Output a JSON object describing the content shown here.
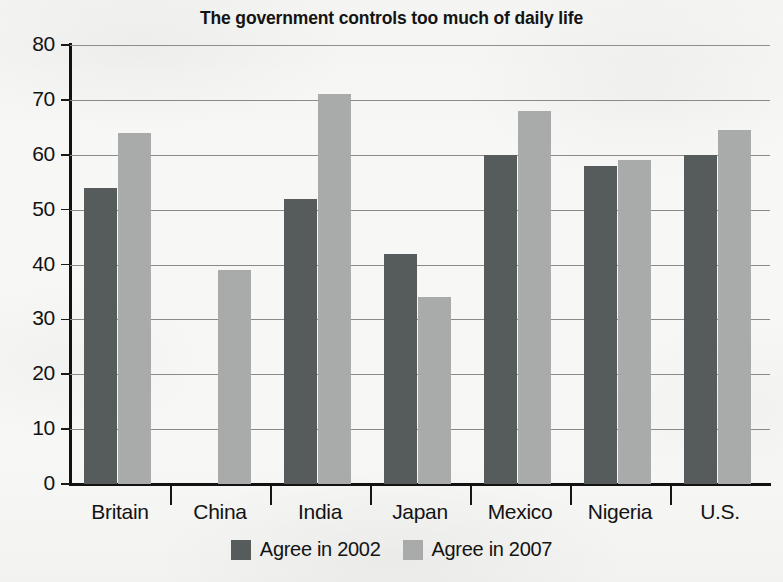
{
  "chart_data": {
    "type": "bar",
    "title": "The government controls too much of daily life",
    "xlabel": "",
    "ylabel": "",
    "ylim": [
      0,
      80
    ],
    "ytick_step": 10,
    "yticks": [
      "80",
      "70",
      "60",
      "50",
      "40",
      "30",
      "20",
      "10",
      "0"
    ],
    "grid": true,
    "legend_position": "bottom",
    "categories": [
      "Britain",
      "China",
      "India",
      "Japan",
      "Mexico",
      "Nigeria",
      "U.S."
    ],
    "series": [
      {
        "name": "Agree in 2002",
        "color": "#565b5b",
        "values": [
          54,
          null,
          52,
          42,
          60,
          58,
          60
        ]
      },
      {
        "name": "Agree in 2007",
        "color": "#a9abaa",
        "values": [
          64,
          39,
          71,
          34,
          68,
          59,
          64.5
        ]
      }
    ]
  },
  "legend": {
    "items": [
      {
        "label": "Agree in 2002",
        "color": "#565b5b"
      },
      {
        "label": "Agree in 2007",
        "color": "#a9abaa"
      }
    ]
  },
  "colors": {
    "background": "#f7f7f5",
    "axis": "#121212",
    "gridline": "#8a8a88",
    "text": "#131313",
    "series_2002": "#565b5b",
    "series_2007": "#a9abaa"
  }
}
